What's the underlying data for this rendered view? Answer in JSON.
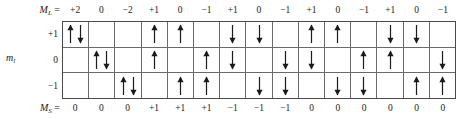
{
  "figure": {
    "type": "microstate-table",
    "row_axis_label": "m",
    "row_axis_subscript": "l",
    "column_header_label": "M",
    "column_header_subscript": "L",
    "column_header_equals": " = ",
    "footer_label": "M",
    "footer_subscript": "S",
    "footer_equals": " = ",
    "row_labels": [
      "+1",
      "0",
      "−1"
    ],
    "ml_values": [
      "+2",
      "0",
      "−2",
      "+1",
      "0",
      "−1",
      "+1",
      "0",
      "−1",
      "+1",
      "0",
      "−1",
      "+1",
      "0",
      "−1"
    ],
    "ms_values": [
      "0",
      "0",
      "0",
      "+1",
      "+1",
      "+1",
      "−1",
      "−1",
      "−1",
      "0",
      "0",
      "0",
      "0",
      "0",
      "0"
    ],
    "grid_line_color": "#6a6a6a",
    "border_color": "#4a4a4a",
    "arrow_color": "#1a1a1a",
    "columns": 15,
    "rows": 3,
    "cells": [
      [
        [
          "up",
          "down"
        ],
        [],
        [],
        [
          "up"
        ],
        [
          "up"
        ],
        [],
        [
          "down"
        ],
        [
          "down"
        ],
        [],
        [
          "up"
        ],
        [
          "up"
        ],
        [],
        [
          "down"
        ],
        [
          "down"
        ],
        []
      ],
      [
        [],
        [
          "up",
          "down"
        ],
        [],
        [
          "up"
        ],
        [],
        [
          "up"
        ],
        [
          "down"
        ],
        [],
        [
          "down"
        ],
        [
          "down"
        ],
        [],
        [
          "up"
        ],
        [
          "up"
        ],
        [],
        [
          "down"
        ]
      ],
      [
        [],
        [],
        [
          "up",
          "down"
        ],
        [],
        [
          "up"
        ],
        [
          "up"
        ],
        [],
        [
          "down"
        ],
        [
          "down"
        ],
        [],
        [
          "down"
        ],
        [
          "down"
        ],
        [],
        [
          "up"
        ],
        [
          "up"
        ]
      ]
    ]
  },
  "chart_data": {
    "type": "table",
    "title": "",
    "xlabel": "M_L",
    "ylabel": "m_l",
    "categories": [
      "+2",
      "0",
      "−2",
      "+1",
      "0",
      "−1",
      "+1",
      "0",
      "−1",
      "+1",
      "0",
      "−1",
      "+1",
      "0",
      "−1"
    ],
    "series": [
      {
        "name": "M_L",
        "values": [
          "+2",
          "0",
          "−2",
          "+1",
          "0",
          "−1",
          "+1",
          "0",
          "−1",
          "+1",
          "0",
          "−1",
          "+1",
          "0",
          "−1"
        ]
      },
      {
        "name": "M_S",
        "values": [
          "0",
          "0",
          "0",
          "+1",
          "+1",
          "+1",
          "−1",
          "−1",
          "−1",
          "0",
          "0",
          "0",
          "0",
          "0",
          "0"
        ]
      }
    ],
    "row_categories": [
      "+1",
      "0",
      "−1"
    ],
    "cell_spins": [
      [
        [
          "up",
          "down"
        ],
        [],
        [],
        [
          "up"
        ],
        [
          "up"
        ],
        [],
        [
          "down"
        ],
        [
          "down"
        ],
        [],
        [
          "up"
        ],
        [
          "up"
        ],
        [],
        [
          "down"
        ],
        [
          "down"
        ],
        []
      ],
      [
        [],
        [
          "up",
          "down"
        ],
        [],
        [
          "up"
        ],
        [],
        [
          "up"
        ],
        [
          "down"
        ],
        [],
        [
          "down"
        ],
        [
          "down"
        ],
        [],
        [
          "up"
        ],
        [
          "up"
        ],
        [],
        [
          "down"
        ]
      ],
      [
        [],
        [],
        [
          "up",
          "down"
        ],
        [],
        [
          "up"
        ],
        [
          "up"
        ],
        [],
        [
          "down"
        ],
        [
          "down"
        ],
        [],
        [
          "down"
        ],
        [
          "down"
        ],
        [],
        [
          "up"
        ],
        [
          "up"
        ]
      ]
    ],
    "grid": true,
    "legend": "none"
  }
}
